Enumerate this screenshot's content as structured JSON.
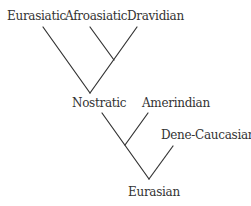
{
  "diagram": {
    "type": "language-family-tree",
    "line_color": "#333333",
    "nodes": [
      {
        "id": "eurasiatic",
        "label": "Eurasiatic",
        "x": 7,
        "y": 9
      },
      {
        "id": "afroasiatic",
        "label": "Afroasiatic",
        "x": 65,
        "y": 9
      },
      {
        "id": "dravidian",
        "label": "Dravidian",
        "x": 127,
        "y": 9
      },
      {
        "id": "nostratic",
        "label": "Nostratic",
        "x": 72,
        "y": 96
      },
      {
        "id": "amerindian",
        "label": "Amerindian",
        "x": 142,
        "y": 96
      },
      {
        "id": "dene-caucasian",
        "label": "Dene-Caucasian",
        "x": 161,
        "y": 128
      },
      {
        "id": "eurasian",
        "label": "Eurasian",
        "x": 128,
        "y": 185
      }
    ],
    "edges": [
      {
        "from": "eurasiatic",
        "to": "nostratic"
      },
      {
        "from": "afroasiatic",
        "to": "afro-dravidian-junction"
      },
      {
        "from": "dravidian",
        "to": "nostratic"
      },
      {
        "from": "nostratic",
        "to": "eurasian"
      },
      {
        "from": "amerindian",
        "to": "nostratic-amerindian-junction"
      },
      {
        "from": "dene-caucasian",
        "to": "eurasian"
      }
    ]
  }
}
